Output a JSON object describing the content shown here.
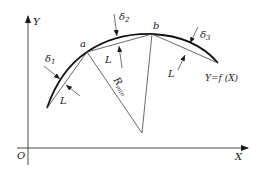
{
  "diagram": {
    "axes": {
      "x_label": "X",
      "y_label": "Y",
      "origin_label": "O"
    },
    "points": {
      "a": "a",
      "b": "b"
    },
    "deviations": {
      "d1": "δ",
      "d1_sub": "1",
      "d2": "δ",
      "d2_sub": "2",
      "d3": "δ",
      "d3_sub": "3"
    },
    "segment_labels": {
      "l1": "L",
      "l2": "L",
      "l3": "L"
    },
    "radius": {
      "label": "R",
      "sub": "min"
    },
    "curve_label": "Y=f (X)",
    "colors": {
      "line": "#1a1a1a",
      "thin_line": "#444444",
      "background": "#ffffff"
    }
  }
}
